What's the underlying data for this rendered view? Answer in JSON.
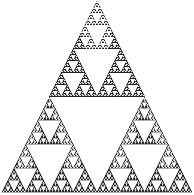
{
  "figure": {
    "name": "sierpinski-triangle",
    "title": "Sierpinski Triangle",
    "width": 194,
    "height": 195
  },
  "chart_data": {
    "type": "scatter",
    "title": "Sierpinski Triangle",
    "subtitle": "",
    "xlabel": "",
    "ylabel": "",
    "grid": false,
    "legend": null,
    "tick_labels": {
      "x": [],
      "y": []
    },
    "annotations": [],
    "fractal": {
      "name": "Sierpinski triangle",
      "construction": "recursive-subdivision",
      "iterations": 6,
      "subdivision_ratio": 0.5,
      "children_per_node": 3,
      "removed_child": "center-inverted",
      "smallest_unit_px": 6,
      "vertices": {
        "apex": [
          97,
          1
        ],
        "bottom_left": [
          2,
          192
        ],
        "bottom_right": [
          192,
          192
        ]
      },
      "base_width_px": 190,
      "height_px": 191,
      "total_smallest_triangles": 729
    },
    "xlim": [
      0,
      194
    ],
    "ylim": [
      0,
      195
    ]
  },
  "style": {
    "background_color": "#ffffff",
    "fill_color": "#2b2b2b",
    "stroke_color": "#1a1a1a",
    "inner_hole_color": "#ffffff",
    "stroke_width": 0.35
  }
}
